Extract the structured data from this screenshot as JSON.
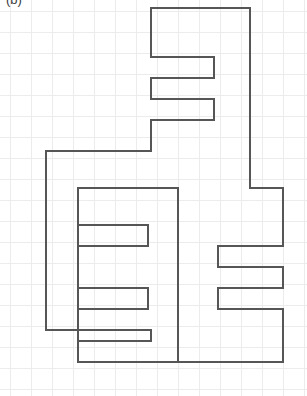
{
  "figure": {
    "panel_label": "(b)",
    "caption": "",
    "background_color": "#ffffff",
    "canvas": {
      "width": 307,
      "height": 396
    }
  },
  "grid": {
    "visible": true,
    "cell_size_px": 21,
    "origin_x_px": 10,
    "origin_y_px": 11,
    "columns": 14,
    "rows": 18,
    "line_color": "#ececec",
    "line_width_px": 1
  },
  "polygon": {
    "name": "orthogonal-polygon",
    "stroke_color": "#565656",
    "stroke_width_px": 2,
    "fill": "none",
    "fill_color": "#ffffff",
    "vertex_count": 40,
    "outline_points": "151,8 250,8 250,188 283,188 283,246 218,246 218,267 283,267 283,288 218,288 218,309 283,309 283,362 78,362 78,341 151,341 151,330 46,330 46,151 151,151 151,120 214,120 214,99 151,99 151,78 214,78 214,57 151,57",
    "path_d": "M 151 8 L 250 8 L 250 188 L 283 188 L 283 246 L 218 246 L 218 267 L 283 267 L 283 288 L 218 288 L 218 309 L 283 309 L 283 362 L 78 362 L 78 341 L 151 341 L 151 330 L 46 330 L 46 151 L 151 151 L 151 120 L 214 120 L 214 99 L 151 99 L 151 78 L 214 78 L 214 57 L 151 57 Z"
  },
  "segments": {
    "interior_vertical_divider": {
      "x": 178,
      "y1": 188,
      "y2": 362
    },
    "left_comb_arms": [
      {
        "y": 188,
        "x1": 78,
        "x2": 178
      },
      {
        "y": 225,
        "x1": 78,
        "x2": 148
      },
      {
        "y": 246,
        "x1": 78,
        "x2": 148
      },
      {
        "y": 288,
        "x1": 78,
        "x2": 148
      },
      {
        "y": 309,
        "x1": 78,
        "x2": 148
      }
    ],
    "left_comb_tips": [
      {
        "x": 148,
        "y1": 225,
        "y2": 246
      },
      {
        "x": 148,
        "y1": 288,
        "y2": 309
      }
    ],
    "left_comb_spine": {
      "x": 78,
      "y1": 188,
      "y2": 362
    }
  },
  "figure_path_full": "M151,8 H250 V188 H283 V246 H218 V267 H283 V288 H218 V309 H283 V362 H78 V341 H151 V330 H46 V151 H151 V120 H214 V99 H151 V78 H214 V57 H151 Z M178,188 V362 M78,188 H178 M78,225 H148 V246 H78 M78,288 H148 V309 H78 M78,188 V362"
}
